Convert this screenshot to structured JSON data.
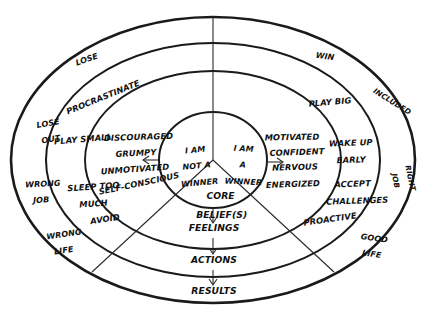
{
  "diagram": {
    "style": "hand-drawn concentric ellipses",
    "ink_color": "#1a1a1a",
    "background_color": "#ffffff",
    "flow_labels": {
      "core": "CORE\nBELIEF(S)",
      "core_line1": "CORE",
      "core_line2": "BELIEF(S)",
      "feelings": "FEELINGS",
      "actions": "ACTIONS",
      "results": "RESULTS"
    },
    "center": {
      "left_belief": "I AM\nNOT A\nWINNER",
      "left_belief_line1": "I AM",
      "left_belief_line2": "NOT A",
      "left_belief_line3": "WINNER",
      "right_belief": "I AM\nA\nWINNER",
      "right_belief_line1": "I AM",
      "right_belief_line2": "A",
      "right_belief_line3": "WINNER"
    },
    "negative_side": {
      "feelings": [
        "DISCOURAGED",
        "GRUMPY",
        "UNMOTIVATED",
        "SELF-CONSCIOUS"
      ],
      "actions": [
        "PROCRASTINATE",
        "PLAY SMALL",
        "SLEEP TOO\nMUCH",
        "AVOID"
      ],
      "actions_sleep_line1": "SLEEP TOO",
      "actions_sleep_line2": "MUCH",
      "results": [
        "LOSE",
        "LOSE\nOUT",
        "WRONG\nJOB",
        "WRONG\nLIFE"
      ],
      "results_lose": "LOSE",
      "results_lose_out_line1": "LOSE",
      "results_lose_out_line2": "OUT",
      "results_wrong_job_line1": "WRONG",
      "results_wrong_job_line2": "JOB",
      "results_wrong_life_line1": "WRONG",
      "results_wrong_life_line2": "LIFE"
    },
    "positive_side": {
      "feelings": [
        "MOTIVATED",
        "CONFIDENT",
        "NERVOUS",
        "ENERGIZED"
      ],
      "actions": [
        "PLAY BIG",
        "WAKE UP\nEARLY",
        "ACCEPT\nCHALLENGES",
        "PROACTIVE"
      ],
      "actions_wake_line1": "WAKE UP",
      "actions_wake_line2": "EARLY",
      "actions_accept_line1": "ACCEPT",
      "actions_accept_line2": "CHALLENGES",
      "results": [
        "WIN",
        "INCLUDED",
        "RIGHT\nJOB",
        "GOOD\nLIFE"
      ],
      "results_win": "WIN",
      "results_included": "INCLUDED",
      "results_right_job_line1": "RIGHT",
      "results_right_job_line2": "JOB",
      "results_good_life_line1": "GOOD",
      "results_good_life_line2": "LIFE"
    }
  }
}
